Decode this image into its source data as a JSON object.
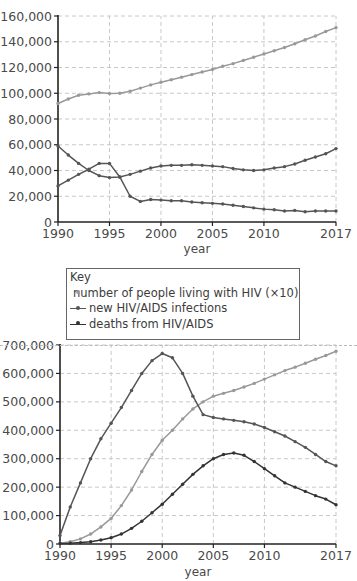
{
  "chart_data": [
    {
      "type": "line",
      "title": "",
      "xlabel": "year",
      "ylabel": "",
      "ylim": [
        0,
        160000
      ],
      "xlim": [
        1990,
        2017
      ],
      "grid": true,
      "x_ticks": [
        "1990",
        "1995",
        "2000",
        "2005",
        "2010",
        "2017"
      ],
      "y_ticks": [
        "0",
        "20,000",
        "40,000",
        "60,000",
        "80,000",
        "100,000",
        "120,000",
        "140,000",
        "160,000"
      ],
      "x": [
        1990,
        1991,
        1992,
        1993,
        1994,
        1995,
        1996,
        1997,
        1998,
        1999,
        2000,
        2001,
        2002,
        2003,
        2004,
        2005,
        2006,
        2007,
        2008,
        2009,
        2010,
        2011,
        2012,
        2013,
        2014,
        2015,
        2016,
        2017
      ],
      "series": [
        {
          "name": "number of people living with HIV (×10)",
          "color": "#999999",
          "values": [
            92000,
            95500,
            98500,
            99500,
            100500,
            99800,
            100000,
            101500,
            104000,
            106500,
            108500,
            110500,
            112500,
            114500,
            116500,
            118500,
            121000,
            123000,
            125500,
            128000,
            130500,
            133000,
            135500,
            138500,
            141500,
            144500,
            148000,
            151000
          ]
        },
        {
          "name": "new HIV/AIDS infections",
          "color": "#555555",
          "values": [
            28000,
            32500,
            37000,
            41000,
            45500,
            45500,
            35000,
            20000,
            16000,
            17500,
            17000,
            16500,
            16500,
            15500,
            15000,
            14500,
            14000,
            13000,
            12000,
            11000,
            10000,
            9500,
            8500,
            9000,
            8000,
            8500,
            8500,
            8500
          ]
        },
        {
          "name": "deaths from HIV/AIDS",
          "color": "#555555",
          "values": [
            59000,
            52000,
            45500,
            40000,
            36000,
            34500,
            35000,
            37000,
            39500,
            42000,
            43500,
            44000,
            44000,
            44500,
            44000,
            43500,
            43000,
            41500,
            40500,
            40000,
            40500,
            42000,
            43000,
            45000,
            48000,
            50500,
            53000,
            57000
          ]
        }
      ]
    },
    {
      "type": "line",
      "title": "",
      "xlabel": "year",
      "ylabel": "",
      "ylim": [
        0,
        700000
      ],
      "xlim": [
        1990,
        2017
      ],
      "grid": true,
      "x_ticks": [
        "1990",
        "1995",
        "2000",
        "2005",
        "2010",
        "2017"
      ],
      "y_ticks": [
        "0",
        "100,000",
        "200,000",
        "300,000",
        "400,000",
        "500,000",
        "600,000",
        "700,000"
      ],
      "x": [
        1990,
        1991,
        1992,
        1993,
        1994,
        1995,
        1996,
        1997,
        1998,
        1999,
        2000,
        2001,
        2002,
        2003,
        2004,
        2005,
        2006,
        2007,
        2008,
        2009,
        2010,
        2011,
        2012,
        2013,
        2014,
        2015,
        2016,
        2017
      ],
      "series": [
        {
          "name": "number of people living with HIV (×10)",
          "color": "#999999",
          "values": [
            3000,
            8000,
            18000,
            35000,
            60000,
            90000,
            135000,
            190000,
            255000,
            315000,
            365000,
            400000,
            440000,
            475000,
            500000,
            520000,
            530000,
            540000,
            552000,
            565000,
            580000,
            595000,
            610000,
            622000,
            636000,
            650000,
            663000,
            678000
          ]
        },
        {
          "name": "new HIV/AIDS infections",
          "color": "#555555",
          "values": [
            30000,
            130000,
            215000,
            300000,
            370000,
            425000,
            480000,
            540000,
            600000,
            645000,
            670000,
            655000,
            600000,
            520000,
            455000,
            445000,
            440000,
            435000,
            430000,
            422000,
            410000,
            395000,
            380000,
            360000,
            340000,
            315000,
            290000,
            275000
          ]
        },
        {
          "name": "deaths from HIV/AIDS",
          "color": "#333333",
          "values": [
            2000,
            3000,
            5000,
            8000,
            14000,
            22000,
            35000,
            55000,
            80000,
            110000,
            140000,
            175000,
            210000,
            245000,
            275000,
            300000,
            315000,
            320000,
            312000,
            290000,
            265000,
            240000,
            215000,
            200000,
            185000,
            170000,
            158000,
            138000
          ]
        }
      ]
    }
  ],
  "legend": {
    "title": "Key",
    "items": [
      {
        "label": "number of  people living with HIV (×10)",
        "color": "#999999"
      },
      {
        "label": "new HIV/AIDS infections",
        "color": "#555555"
      },
      {
        "label": "deaths from HIV/AIDS",
        "color": "#333333"
      }
    ]
  }
}
